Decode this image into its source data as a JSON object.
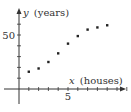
{
  "chart_data": {
    "type": "scatter",
    "title": "",
    "xlabel_var": "x",
    "xlabel_unit": "(houses)",
    "ylabel_var": "y",
    "ylabel_unit": "(years)",
    "x_tick_labels": [
      {
        "value": 5,
        "label": "5"
      }
    ],
    "y_tick_labels": [
      {
        "value": 50,
        "label": "50"
      }
    ],
    "x_ticks": [
      1,
      2,
      3,
      4,
      5,
      6,
      7,
      8,
      9,
      10,
      11
    ],
    "y_ticks": [
      10,
      20,
      30,
      40,
      50,
      60
    ],
    "xlim": [
      -0.5,
      12
    ],
    "ylim": [
      -20,
      75
    ],
    "grid": false,
    "points": [
      {
        "x": 1,
        "y": 16
      },
      {
        "x": 2,
        "y": 19
      },
      {
        "x": 3,
        "y": 25
      },
      {
        "x": 4,
        "y": 33
      },
      {
        "x": 5,
        "y": 42
      },
      {
        "x": 6,
        "y": 49
      },
      {
        "x": 7,
        "y": 55
      },
      {
        "x": 8,
        "y": 57
      },
      {
        "x": 9,
        "y": 59
      }
    ]
  }
}
